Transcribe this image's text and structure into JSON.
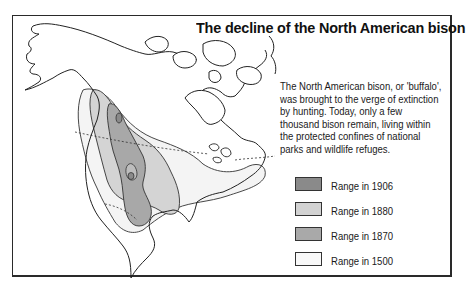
{
  "title": "The decline of the North American bison",
  "description": "The North American bison, or 'buffalo', was brought to the verge of extinction by hunting. Today, only a few thousand bison remain, living within the protected confines of national parks and wildlife refuges.",
  "legend": {
    "items": [
      {
        "label": "Range in 1906",
        "color": "#8a8a8a"
      },
      {
        "label": "Range in 1880",
        "color": "#d2d2d2"
      },
      {
        "label": "Range in 1870",
        "color": "#a9a9a9"
      },
      {
        "label": "Range in 1500",
        "color": "#f4f4f4"
      }
    ]
  },
  "map": {
    "subject": "North America",
    "regions": [
      "range-1500",
      "range-1870",
      "range-1880",
      "range-1906"
    ]
  }
}
